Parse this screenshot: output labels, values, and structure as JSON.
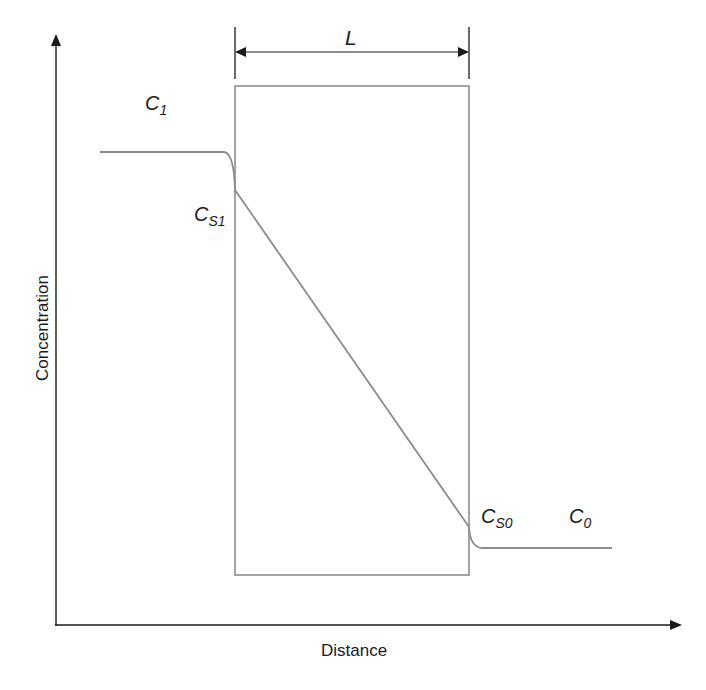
{
  "diagram": {
    "type": "concentration-profile-across-membrane",
    "axes": {
      "x_label": "Distance",
      "y_label": "Concentration"
    },
    "dimension": {
      "label": "L",
      "description": "membrane thickness"
    },
    "labels": {
      "c1": {
        "main": "C",
        "sub": "1"
      },
      "cs1": {
        "main": "C",
        "sub": "S1"
      },
      "cs0": {
        "main": "C",
        "sub": "S0"
      },
      "c0": {
        "main": "C",
        "sub": "0"
      }
    },
    "colors": {
      "axis": "#1a1a1a",
      "profile": "#8c8c8c",
      "membrane": "#9a9a9a",
      "text": "#1a1a1a"
    }
  }
}
